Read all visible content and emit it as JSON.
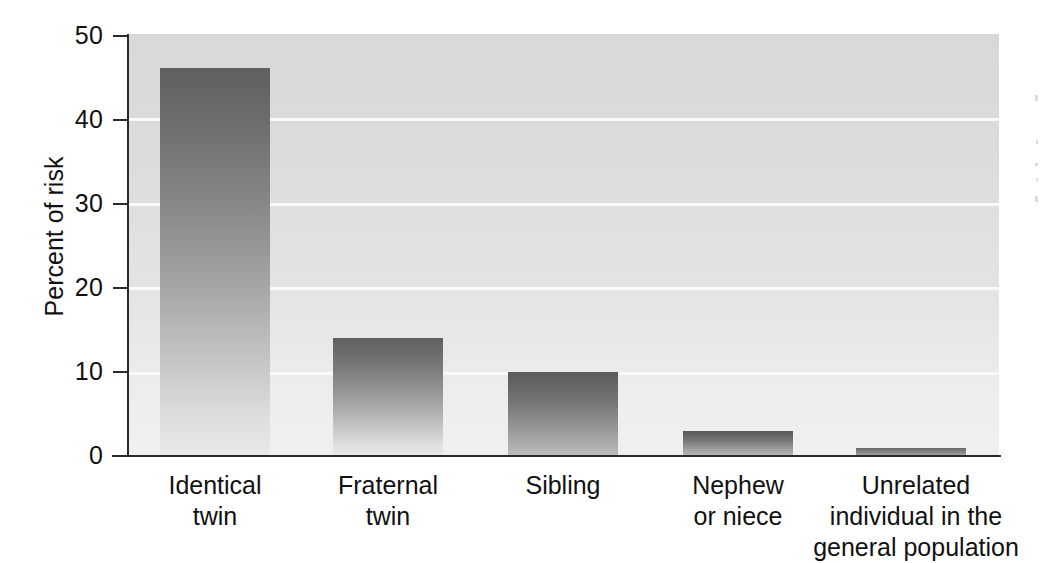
{
  "chart_data": {
    "type": "bar",
    "title": "",
    "xlabel": "",
    "ylabel": "Percent of risk",
    "ylim": [
      0,
      50
    ],
    "ytick_labels": [
      "0",
      "10",
      "20",
      "30",
      "40",
      "50"
    ],
    "ytick_values": [
      0,
      10,
      20,
      30,
      40,
      50
    ],
    "grid": true,
    "gridlines_at": [
      10,
      20,
      30,
      40
    ],
    "legend": "none",
    "categories": [
      "Identical twin",
      "Fraternal twin",
      "Sibling",
      "Nephew or niece",
      "Unrelated individual in the general population"
    ],
    "category_label_lines": [
      [
        "Identical",
        "twin"
      ],
      [
        "Fraternal",
        "twin"
      ],
      [
        "Sibling"
      ],
      [
        "Nephew",
        "or niece"
      ],
      [
        "Unrelated",
        "individual in the",
        "general population"
      ]
    ],
    "values": [
      46,
      14,
      10,
      3,
      1
    ],
    "bar_color_top": "#5f5f5f",
    "bar_color_bottom": "#e9e9e9",
    "plot_background_top": "#d8d8d8",
    "plot_background_bottom": "#f0f0f0",
    "gridline_color": "#fbfbfb",
    "axis_color": "#2b2b2b"
  }
}
